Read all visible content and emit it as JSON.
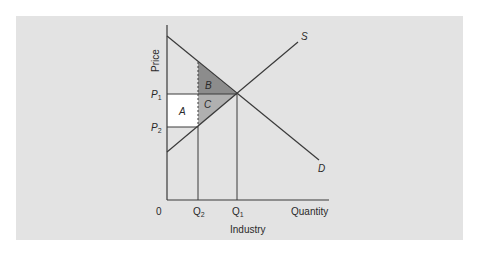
{
  "diagram": {
    "caption": "Industry",
    "y_axis_label": "Price",
    "x_axis_label": "Quantity",
    "origin_label": "0",
    "price_ticks": [
      {
        "main": "P",
        "sub": "1"
      },
      {
        "main": "P",
        "sub": "2"
      }
    ],
    "quantity_ticks": [
      {
        "main": "Q",
        "sub": "2"
      },
      {
        "main": "Q",
        "sub": "1"
      }
    ],
    "curves": {
      "supply": "S",
      "demand": "D"
    },
    "areas": {
      "a": "A",
      "b": "B",
      "c": "C"
    },
    "colors": {
      "background": "#e3e3e3",
      "area_a": "#ffffff",
      "area_b": "#8c8c8c",
      "area_c": "#b0b0b0",
      "lines": "#3a3a3a"
    }
  }
}
